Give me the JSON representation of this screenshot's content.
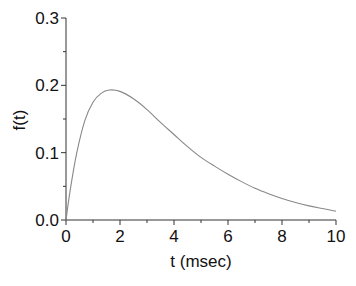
{
  "chart_data": {
    "type": "line",
    "title": "",
    "xlabel": "t (msec)",
    "ylabel": "f(t)",
    "xlim": [
      0,
      10
    ],
    "ylim": [
      0,
      0.3
    ],
    "grid": false,
    "legend": null,
    "x_ticks": [
      "0",
      "2",
      "4",
      "6",
      "8",
      "10"
    ],
    "y_ticks": [
      "0.0",
      "0.1",
      "0.2",
      "0.3"
    ],
    "series": [
      {
        "name": "f(t)",
        "color": "#888888",
        "x": [
          0,
          0.15,
          0.4,
          0.7,
          1.0,
          1.3,
          1.6,
          2.0,
          2.5,
          3.0,
          3.5,
          4.0,
          4.5,
          5.0,
          5.5,
          6.0,
          6.5,
          7.0,
          7.5,
          8.0,
          8.5,
          9.0,
          9.5,
          10.0
        ],
        "values": [
          0,
          0.043,
          0.1,
          0.148,
          0.175,
          0.188,
          0.193,
          0.191,
          0.18,
          0.164,
          0.145,
          0.127,
          0.109,
          0.093,
          0.08,
          0.068,
          0.057,
          0.047,
          0.039,
          0.032,
          0.026,
          0.021,
          0.017,
          0.013
        ]
      }
    ]
  },
  "axes": {
    "x_title": "t (msec)",
    "y_title": "f(t)"
  }
}
